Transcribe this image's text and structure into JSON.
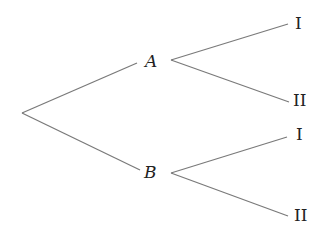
{
  "diagram": {
    "type": "tree",
    "orientation": "left-to-right",
    "colors": {
      "edge": "#7a7a7a",
      "text": "#222222",
      "background": "#ffffff"
    },
    "root": {
      "label": "",
      "children": [
        {
          "label": "A",
          "children": [
            {
              "label": "I"
            },
            {
              "label": "II"
            }
          ]
        },
        {
          "label": "B",
          "children": [
            {
              "label": "I"
            },
            {
              "label": "II"
            }
          ]
        }
      ]
    }
  },
  "labels": {
    "A": "A",
    "B": "B",
    "A_I": "I",
    "A_II": "II",
    "B_I": "I",
    "B_II": "II"
  }
}
